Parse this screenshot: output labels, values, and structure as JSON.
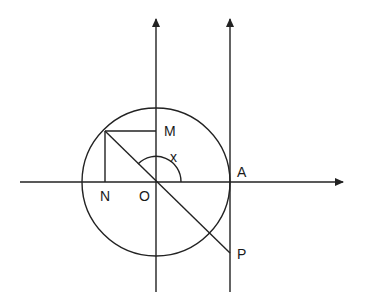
{
  "diagram": {
    "labels": {
      "M": "M",
      "N": "N",
      "O": "O",
      "A": "A",
      "P": "P",
      "x": "x"
    },
    "colors": {
      "stroke": "#222222",
      "background": "#ffffff"
    }
  }
}
